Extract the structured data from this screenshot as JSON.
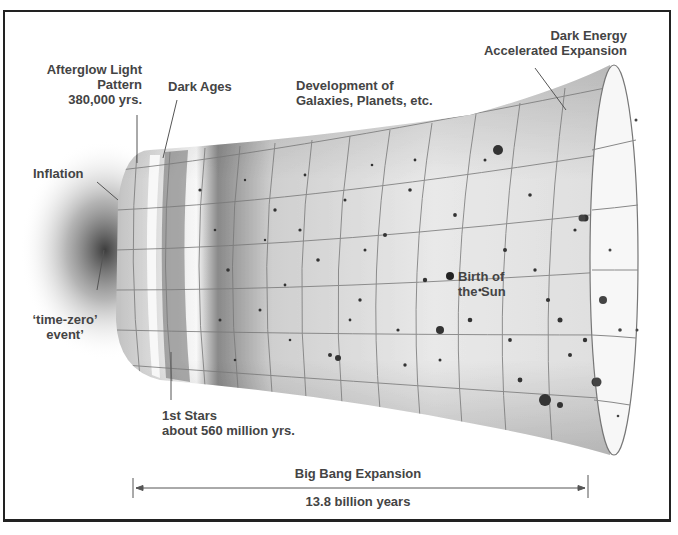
{
  "title": "Big Bang Expansion",
  "labels": {
    "afterglow": {
      "line1": "Afterglow Light",
      "line2": "Pattern",
      "line3": "380,000 yrs."
    },
    "dark_ages": "Dark Ages",
    "development": {
      "line1": "Development of",
      "line2": "Galaxies, Planets, etc."
    },
    "dark_energy": {
      "line1": "Dark Energy",
      "line2": "Accelerated Expansion"
    },
    "inflation": "Inflation",
    "time_zero": {
      "line1": "‘time-zero’",
      "line2": "event’"
    },
    "birth_of_sun": {
      "line1": "Birth of",
      "line2": "the Sun"
    },
    "first_stars": {
      "line1": "1st Stars",
      "line2": "about 560 million yrs."
    }
  },
  "timeline": {
    "label": "Big Bang Expansion",
    "duration": "13.8 billion years"
  },
  "colors": {
    "text": "#444444",
    "frame": "#222222",
    "funnel_fill": "#e4e4e4",
    "grid": "#777777"
  }
}
